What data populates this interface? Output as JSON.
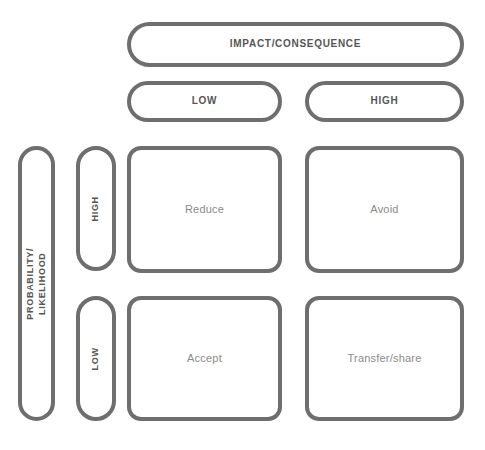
{
  "diagram": {
    "x_axis": {
      "label": "IMPACT/CONSEQUENCE",
      "categories": [
        "LOW",
        "HIGH"
      ]
    },
    "y_axis": {
      "label_line1": "PROBABILITY/",
      "label_line2": "LIKELIHOOD",
      "categories": [
        "HIGH",
        "LOW"
      ]
    },
    "cells": [
      {
        "probability": "HIGH",
        "impact": "LOW",
        "response": "Reduce"
      },
      {
        "probability": "HIGH",
        "impact": "HIGH",
        "response": "Avoid"
      },
      {
        "probability": "LOW",
        "impact": "LOW",
        "response": "Accept"
      },
      {
        "probability": "LOW",
        "impact": "HIGH",
        "response": "Transfer/share"
      }
    ],
    "colors": {
      "border": "#6e6e6e",
      "header_text": "#565656",
      "cell_text": "#8a8a8a",
      "background": "#ffffff"
    }
  }
}
